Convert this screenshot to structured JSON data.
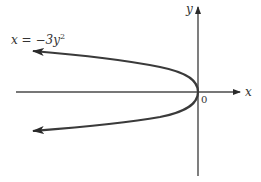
{
  "diagram": {
    "equation_label": {
      "lhs": "x",
      "equals": " = ",
      "rhs_prefix": "−3y",
      "exponent": "2"
    },
    "axes": {
      "x_label": "x",
      "y_label": "y",
      "origin_label": "0"
    },
    "curve": {
      "type": "parabola",
      "equation": "x = -3y^2",
      "opens": "left",
      "vertex": "origin",
      "arrows_on_ends": true
    },
    "colors": {
      "curve": "#3a3a3a",
      "axes": "#3a3a3a",
      "text": "#333333",
      "background": "#ffffff"
    }
  }
}
